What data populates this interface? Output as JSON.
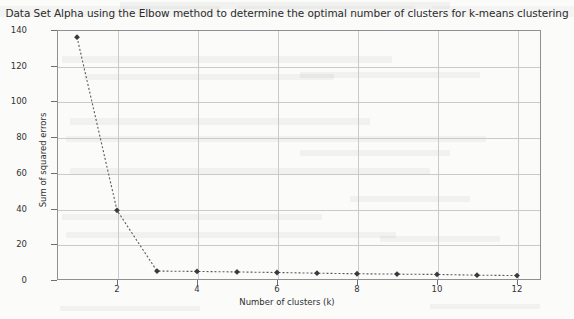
{
  "chart_data": {
    "type": "line",
    "title": "Data Set Alpha using the Elbow method to determine the optimal number of clusters for k-means clustering",
    "xlabel": "Number of clusters (k)",
    "ylabel": "Sum of squared errors",
    "x": [
      1,
      2,
      3,
      4,
      5,
      6,
      7,
      8,
      9,
      10,
      11,
      12
    ],
    "values": [
      136,
      39,
      5.0,
      4.8,
      4.5,
      4.2,
      3.8,
      3.5,
      3.3,
      3.1,
      2.7,
      2.5
    ],
    "series": [
      {
        "name": "Sum of squared errors",
        "values": [
          136,
          39,
          5.0,
          4.8,
          4.5,
          4.2,
          3.8,
          3.5,
          3.3,
          3.1,
          2.7,
          2.5
        ]
      }
    ],
    "xlim": [
      0.5,
      12.6
    ],
    "ylim": [
      0,
      140
    ],
    "xticks": [
      2,
      4,
      6,
      8,
      10,
      12
    ],
    "yticks": [
      0,
      20,
      40,
      60,
      80,
      100,
      120,
      140
    ],
    "grid": true,
    "legend": false,
    "line_style": "dotted",
    "marker": "diamond",
    "colors": {
      "line": "#5a5a5e",
      "marker": "#3a3a3e",
      "grid": "#c9cacd",
      "frame": "#8f9094",
      "text": "#2b2b2b",
      "background": "#fbfbfa"
    }
  }
}
